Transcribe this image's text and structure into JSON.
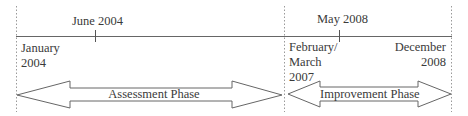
{
  "timeline": {
    "top_labels": [
      {
        "text": "June 2004"
      },
      {
        "text": "May 2008"
      }
    ],
    "boundary_labels": [
      {
        "lines": [
          "January",
          "2004"
        ]
      },
      {
        "lines": [
          "February/",
          "March",
          "2007"
        ]
      },
      {
        "lines": [
          "December",
          "2008"
        ]
      }
    ]
  },
  "phases": [
    {
      "label": "Assessment Phase"
    },
    {
      "label": "Improvement Phase"
    }
  ]
}
